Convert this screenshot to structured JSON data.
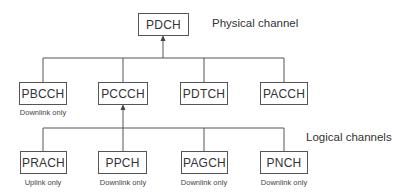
{
  "diagram": {
    "root": {
      "label": "PDCH",
      "annotation": "Physical channel"
    },
    "group_label": "Logical channels",
    "level1": [
      {
        "label": "PBCCH",
        "note": "Downlink only"
      },
      {
        "label": "PCCCH",
        "note": ""
      },
      {
        "label": "PDTCH",
        "note": ""
      },
      {
        "label": "PACCH",
        "note": ""
      }
    ],
    "level2": [
      {
        "label": "PRACH",
        "note": "Uplink only"
      },
      {
        "label": "PPCH",
        "note": "Downlink only"
      },
      {
        "label": "PAGCH",
        "note": "Downlink only"
      },
      {
        "label": "PNCH",
        "note": "Downlink only"
      }
    ],
    "edges": [
      {
        "from": "PBCCH",
        "to": "PDCH",
        "arrow_at": "PDCH"
      },
      {
        "from": "PCCCH",
        "to": "PDCH",
        "arrow_at": "PDCH"
      },
      {
        "from": "PDTCH",
        "to": "PDCH",
        "arrow_at": "PDCH"
      },
      {
        "from": "PACCH",
        "to": "PDCH",
        "arrow_at": "PDCH"
      },
      {
        "from": "PRACH",
        "to": "PCCCH",
        "arrow_at": "PCCCH"
      },
      {
        "from": "PPCH",
        "to": "PCCCH",
        "arrow_at": "PCCCH"
      },
      {
        "from": "PAGCH",
        "to": "PCCCH",
        "arrow_at": "PCCCH"
      },
      {
        "from": "PNCH",
        "to": "PCCCH",
        "arrow_at": "PCCCH"
      }
    ]
  }
}
